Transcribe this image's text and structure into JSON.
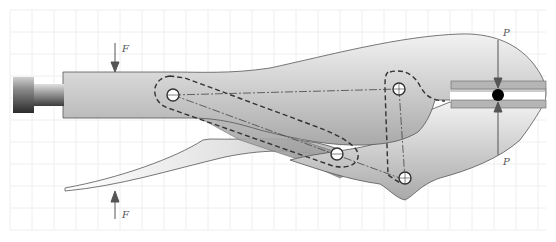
{
  "diagram": {
    "labels": {
      "force_top": "F",
      "force_bottom": "F",
      "jaw_force_top": "P",
      "jaw_force_bottom": "P"
    },
    "components": [
      "adjusting-screw-knob",
      "upper-handle",
      "lower-handle",
      "toggle-link",
      "lower-jaw",
      "upper-jaw-plates",
      "workpiece"
    ],
    "pins": [
      "pin-A",
      "pin-B",
      "pin-C",
      "pin-D"
    ],
    "colors": {
      "body_light": "#f0f0f0",
      "body_dark": "#a8a8a8",
      "outline": "#555555",
      "arrow": "#555555",
      "workpiece": "#000000",
      "grid": "#eeeeee"
    }
  }
}
